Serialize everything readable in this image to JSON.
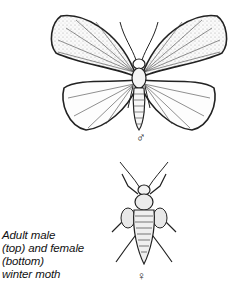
{
  "figure": {
    "male": {
      "label": "male winter moth illustration",
      "symbol": "♂"
    },
    "female": {
      "label": "female winter moth illustration",
      "symbol": "♀"
    },
    "caption": {
      "lines": [
        "Adult male",
        "(top) and female",
        "(bottom)",
        "winter moth"
      ]
    }
  }
}
